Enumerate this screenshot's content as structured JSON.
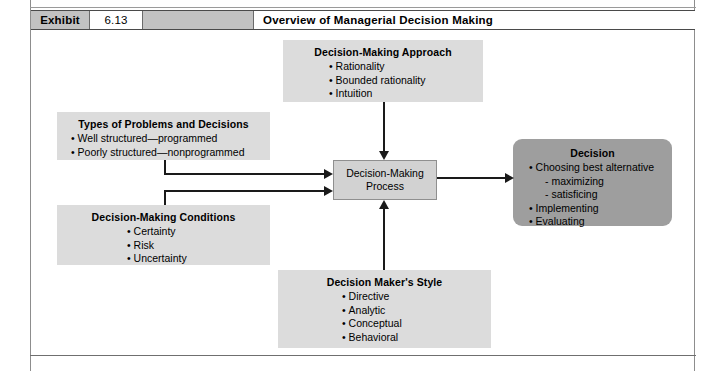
{
  "exhibit_header": {
    "label": "Exhibit",
    "number": "6.13",
    "title": "Overview of Managerial Decision Making"
  },
  "diagram": {
    "nodes": {
      "approach": {
        "title": "Decision-Making Approach",
        "items": [
          "Rationality",
          "Bounded rationality",
          "Intuition"
        ]
      },
      "types": {
        "title": "Types of Problems and Decisions",
        "items": [
          "Well structured—programmed",
          "Poorly structured—nonprogrammed"
        ]
      },
      "conditions": {
        "title": "Decision-Making Conditions",
        "items": [
          "Certainty",
          "Risk",
          "Uncertainty"
        ]
      },
      "style": {
        "title": "Decision Maker's Style",
        "items": [
          "Directive",
          "Analytic",
          "Conceptual",
          "Behavioral"
        ]
      },
      "process": {
        "line1": "Decision-Making",
        "line2": "Process"
      },
      "decision": {
        "title": "Decision",
        "items": [
          "Choosing best alternative",
          "Implementing",
          "Evaluating"
        ],
        "subitems": [
          "maximizing",
          "satisficing"
        ]
      }
    },
    "colors": {
      "node_fill": "#dcdcdc",
      "process_fill": "#d2d2d2",
      "decision_fill": "#9e9e9e",
      "connector": "#1a1a1a",
      "header_fill": "#c2c2c2"
    }
  }
}
